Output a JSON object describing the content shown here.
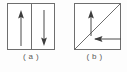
{
  "figure": {
    "type": "diagram",
    "background_color": "#fdfdfd",
    "line_color": "#6e6e6e",
    "arrow_color": "#4a4a4a",
    "text_color": "#5a5a5a",
    "panels": [
      {
        "id": "a",
        "caption": "( a )",
        "shape": "rectangle",
        "divider": "vertical-center-line",
        "arrows": [
          {
            "name": "arrow-up-left-domain",
            "direction": "up",
            "glyph": "↑"
          },
          {
            "name": "arrow-down-right-domain",
            "direction": "down",
            "glyph": "↓"
          }
        ]
      },
      {
        "id": "b",
        "caption": "( b )",
        "shape": "rectangle",
        "divider": "diagonal-line-bottomleft-to-topright",
        "arrows": [
          {
            "name": "arrow-up-upper-domain",
            "direction": "up",
            "glyph": "↑"
          },
          {
            "name": "arrow-left-lower-domain",
            "direction": "left",
            "glyph": "←"
          }
        ]
      }
    ]
  }
}
